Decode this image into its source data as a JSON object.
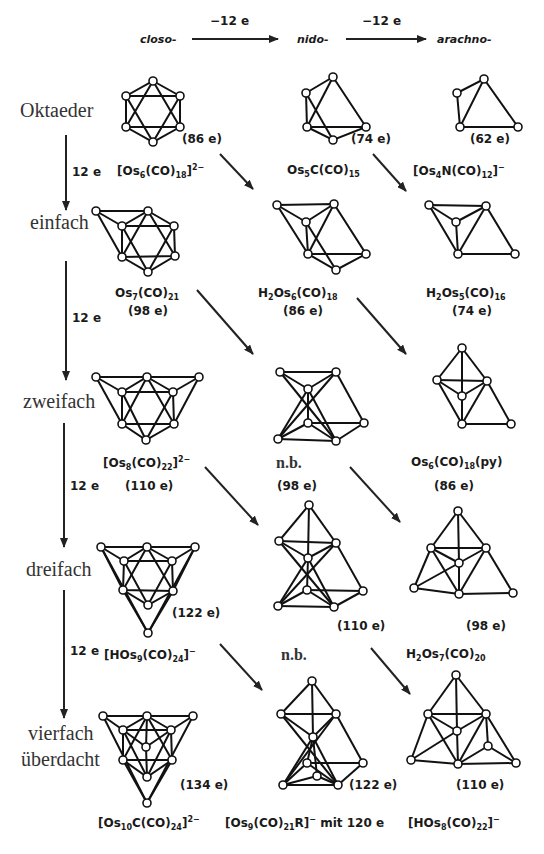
{
  "header": {
    "closo": "closo-",
    "nido": "nido-",
    "arachno": "arachno-",
    "arrow1_label": "−12 e",
    "arrow2_label": "−12 e"
  },
  "rows": [
    {
      "label": "Oktaeder",
      "step": "12 e"
    },
    {
      "label": "einfach",
      "step": "12 e"
    },
    {
      "label": "zweifach",
      "step": "12 e"
    },
    {
      "label": "dreifach",
      "step": "12 e"
    },
    {
      "label": "vierfach"
    },
    {
      "label": "überdacht"
    }
  ],
  "clusters": {
    "r0c0": {
      "e": "(86 e)",
      "formula": "[Os6(CO)18]2−"
    },
    "r0c1": {
      "e": "(74 e)",
      "formula": "Os5C(CO)15"
    },
    "r0c2": {
      "e": "(62 e)",
      "formula": "[Os4N(CO)12]−"
    },
    "r1c0": {
      "e": "(98 e)",
      "formula": "Os7(CO)21"
    },
    "r1c1": {
      "e": "(86 e)",
      "formula": "H2Os6(CO)18"
    },
    "r1c2": {
      "e": "(74 e)",
      "formula": "H2Os5(CO)16"
    },
    "r2c0": {
      "e": "(110 e)",
      "formula": "[Os8(CO)22]2−"
    },
    "r2c1": {
      "e": "(98 e)",
      "formula": "n.b."
    },
    "r2c2": {
      "e": "(86 e)",
      "formula": "Os6(CO)18(py)"
    },
    "r3c0": {
      "e": "(122 e)",
      "formula": "[HOs9(CO)24]−"
    },
    "r3c1": {
      "e": "(110 e)",
      "formula": "n.b."
    },
    "r3c2": {
      "e": "(98 e)",
      "formula": "H2Os7(CO)20"
    },
    "r4c0": {
      "e": "(134 e)",
      "formula": "[Os10C(CO)24]2−"
    },
    "r4c1": {
      "e": "(122 e)",
      "formula": "[Os9(CO)21R]− mit 120 e"
    },
    "r4c2": {
      "e": "(110 e)",
      "formula": "[HOs8(CO)22]−"
    }
  },
  "formula_parts": {
    "r0c0": [
      "[Os",
      "6",
      "(CO)",
      "18",
      "]",
      "2−"
    ],
    "r0c1": [
      "Os",
      "5",
      "C(CO)",
      "15"
    ],
    "r0c2": [
      "[Os",
      "4",
      "N(CO)",
      "12",
      "]",
      "−"
    ],
    "r1c0": [
      "Os",
      "7",
      "(CO)",
      "21"
    ],
    "r1c1": [
      "H",
      "2",
      "Os",
      "6",
      "(CO)",
      "18"
    ],
    "r1c2": [
      "H",
      "2",
      "Os",
      "5",
      "(CO)",
      "16"
    ],
    "r2c0": [
      "[Os",
      "8",
      "(CO)",
      "22",
      "]",
      "2−"
    ],
    "r2c2": [
      "Os",
      "6",
      "(CO)",
      "18",
      "(py)"
    ],
    "r3c0": [
      "[HOs",
      "9",
      "(CO)",
      "24",
      "]",
      "−"
    ],
    "r3c2": [
      "H",
      "2",
      "Os",
      "7",
      "(CO)",
      "20"
    ],
    "r4c0": [
      "[Os",
      "10",
      "C(CO)",
      "24",
      "]",
      "2−"
    ],
    "r4c1": [
      "[Os",
      "9",
      "(CO)",
      "21",
      "R]",
      "−",
      " mit  120 e"
    ],
    "r4c2": [
      "[HOs",
      "8",
      "(CO)",
      "22",
      "]",
      "−"
    ]
  },
  "nb_label": "n.b."
}
